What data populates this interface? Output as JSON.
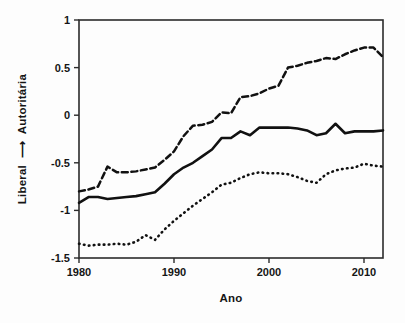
{
  "figure": {
    "name": "line-chart-ideologia",
    "background": "#fdfdfd",
    "ink_color": "#111111"
  },
  "axis": {
    "x_title": "Ano",
    "y_title_left": "Liberal",
    "y_title_arrow": "⟶",
    "y_title_right": "Autoritária",
    "x_ticks": [
      "1980",
      "1990",
      "2000",
      "2010"
    ],
    "y_ticks": [
      "1",
      "0.5",
      "0",
      "-0.5",
      "-1",
      "-1.5"
    ]
  },
  "chart_data": {
    "type": "line",
    "title": "",
    "subtitle": "",
    "xlabel": "Ano",
    "ylabel": "Liberal ⟶ Autoritária",
    "xlim": [
      1980,
      2012
    ],
    "ylim": [
      -1.5,
      1
    ],
    "xticks": [
      1980,
      1990,
      2000,
      2010
    ],
    "yticks": [
      1,
      0.5,
      0,
      -0.5,
      -1,
      -1.5
    ],
    "grid": false,
    "legend": "none",
    "x": [
      1980,
      1981,
      1982,
      1983,
      1984,
      1985,
      1986,
      1987,
      1988,
      1989,
      1990,
      1991,
      1992,
      1993,
      1994,
      1995,
      1996,
      1997,
      1998,
      1999,
      2000,
      2001,
      2002,
      2003,
      2004,
      2005,
      2006,
      2007,
      2008,
      2009,
      2010,
      2011,
      2012
    ],
    "series": [
      {
        "name": "upper-bound",
        "style": "dashed",
        "values": [
          -0.8,
          -0.78,
          -0.75,
          -0.54,
          -0.6,
          -0.6,
          -0.59,
          -0.57,
          -0.55,
          -0.47,
          -0.38,
          -0.22,
          -0.11,
          -0.1,
          -0.07,
          0.03,
          0.02,
          0.19,
          0.2,
          0.23,
          0.28,
          0.31,
          0.5,
          0.52,
          0.55,
          0.57,
          0.6,
          0.59,
          0.64,
          0.68,
          0.71,
          0.71,
          0.61
        ]
      },
      {
        "name": "point-estimate",
        "style": "solid",
        "values": [
          -0.92,
          -0.86,
          -0.86,
          -0.88,
          -0.87,
          -0.86,
          -0.85,
          -0.83,
          -0.81,
          -0.72,
          -0.62,
          -0.55,
          -0.5,
          -0.43,
          -0.36,
          -0.24,
          -0.24,
          -0.17,
          -0.21,
          -0.13,
          -0.13,
          -0.13,
          -0.13,
          -0.14,
          -0.16,
          -0.21,
          -0.19,
          -0.09,
          -0.19,
          -0.17,
          -0.17,
          -0.17,
          -0.16
        ]
      },
      {
        "name": "lower-bound",
        "style": "dotted",
        "values": [
          -1.35,
          -1.37,
          -1.36,
          -1.36,
          -1.35,
          -1.36,
          -1.33,
          -1.26,
          -1.31,
          -1.2,
          -1.11,
          -1.03,
          -0.95,
          -0.88,
          -0.81,
          -0.73,
          -0.71,
          -0.66,
          -0.62,
          -0.6,
          -0.61,
          -0.61,
          -0.62,
          -0.65,
          -0.69,
          -0.71,
          -0.62,
          -0.58,
          -0.56,
          -0.55,
          -0.51,
          -0.53,
          -0.54
        ]
      }
    ]
  }
}
